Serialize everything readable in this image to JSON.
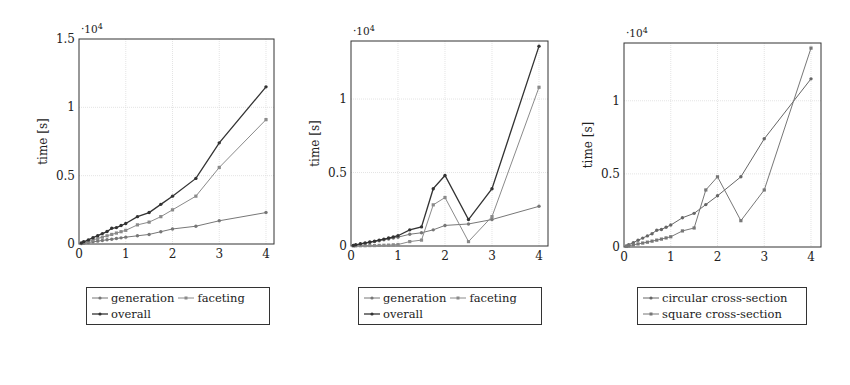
{
  "chart_data": [
    {
      "type": "line",
      "title": "",
      "xlabel": "number of structural members",
      "x_multiplier": "·10^5",
      "ylabel": "time [s]",
      "y_multiplier": "·10^4",
      "xlim": [
        0,
        4.2
      ],
      "ylim": [
        0,
        1.5
      ],
      "xticks": [
        "0",
        "1",
        "2",
        "3",
        "4"
      ],
      "yticks": [
        "0",
        "0.5",
        "1",
        "1.5"
      ],
      "grid": true,
      "legend_position": "below",
      "x": [
        0.05,
        0.1,
        0.2,
        0.3,
        0.4,
        0.5,
        0.6,
        0.7,
        0.8,
        0.9,
        1.0,
        1.25,
        1.5,
        1.75,
        2.0,
        2.5,
        3.0,
        4.0
      ],
      "series": [
        {
          "name": "generation",
          "color": "#777777",
          "marker": "circle",
          "values": [
            0.003,
            0.006,
            0.011,
            0.016,
            0.021,
            0.026,
            0.031,
            0.035,
            0.04,
            0.045,
            0.05,
            0.06,
            0.07,
            0.09,
            0.11,
            0.13,
            0.17,
            0.23
          ]
        },
        {
          "name": "faceting",
          "color": "#8a8a8a",
          "marker": "square",
          "values": [
            0.004,
            0.01,
            0.019,
            0.03,
            0.04,
            0.05,
            0.06,
            0.07,
            0.08,
            0.09,
            0.1,
            0.14,
            0.16,
            0.2,
            0.25,
            0.35,
            0.56,
            0.91
          ]
        },
        {
          "name": "overall",
          "color": "#333333",
          "marker": "circle",
          "values": [
            0.007,
            0.016,
            0.03,
            0.046,
            0.061,
            0.076,
            0.091,
            0.115,
            0.12,
            0.135,
            0.15,
            0.2,
            0.23,
            0.29,
            0.35,
            0.48,
            0.74,
            1.15
          ]
        }
      ]
    },
    {
      "type": "line",
      "title": "",
      "xlabel": "number of structural members",
      "x_multiplier": "·10^5",
      "ylabel": "time [s]",
      "y_multiplier": "·10^4",
      "xlim": [
        0,
        4.2
      ],
      "ylim": [
        0,
        1.39
      ],
      "xticks": [
        "0",
        "1",
        "2",
        "3",
        "4"
      ],
      "yticks": [
        "0",
        "0.5",
        "1"
      ],
      "grid": true,
      "legend_position": "below",
      "x": [
        0.05,
        0.1,
        0.2,
        0.3,
        0.4,
        0.5,
        0.6,
        0.7,
        0.8,
        0.9,
        1.0,
        1.25,
        1.5,
        1.75,
        2.0,
        2.5,
        3.0,
        4.0
      ],
      "series": [
        {
          "name": "generation",
          "color": "#777777",
          "marker": "circle",
          "values": [
            0.003,
            0.006,
            0.012,
            0.018,
            0.024,
            0.03,
            0.036,
            0.042,
            0.048,
            0.054,
            0.06,
            0.08,
            0.09,
            0.11,
            0.14,
            0.15,
            0.18,
            0.27
          ]
        },
        {
          "name": "faceting",
          "color": "#8a8a8a",
          "marker": "square",
          "values": [
            0.0005,
            0.001,
            0.002,
            0.002,
            0.003,
            0.003,
            0.004,
            0.005,
            0.006,
            0.008,
            0.01,
            0.03,
            0.04,
            0.28,
            0.33,
            0.03,
            0.2,
            1.08
          ]
        },
        {
          "name": "overall",
          "color": "#333333",
          "marker": "circle",
          "values": [
            0.004,
            0.008,
            0.015,
            0.021,
            0.027,
            0.033,
            0.04,
            0.047,
            0.054,
            0.062,
            0.07,
            0.11,
            0.13,
            0.39,
            0.48,
            0.18,
            0.39,
            1.36
          ]
        }
      ]
    },
    {
      "type": "line",
      "title": "",
      "xlabel": "number of structural members",
      "x_multiplier": "·10^5",
      "ylabel": "time [s]",
      "y_multiplier": "·10^4",
      "xlim": [
        0,
        4.2
      ],
      "ylim": [
        0,
        1.39
      ],
      "xticks": [
        "0",
        "1",
        "2",
        "3",
        "4"
      ],
      "yticks": [
        "0",
        "0.5",
        "1"
      ],
      "grid": true,
      "legend_position": "below",
      "x": [
        0.05,
        0.1,
        0.2,
        0.3,
        0.4,
        0.5,
        0.6,
        0.7,
        0.8,
        0.9,
        1.0,
        1.25,
        1.5,
        1.75,
        2.0,
        2.5,
        3.0,
        4.0
      ],
      "series": [
        {
          "name": "circular cross-section",
          "color": "#666666",
          "marker": "circle",
          "values": [
            0.007,
            0.016,
            0.03,
            0.046,
            0.061,
            0.076,
            0.091,
            0.115,
            0.12,
            0.135,
            0.15,
            0.2,
            0.23,
            0.29,
            0.35,
            0.48,
            0.74,
            1.15
          ]
        },
        {
          "name": "square cross-section",
          "color": "#777777",
          "marker": "square",
          "values": [
            0.004,
            0.008,
            0.015,
            0.021,
            0.027,
            0.033,
            0.04,
            0.047,
            0.054,
            0.062,
            0.07,
            0.11,
            0.13,
            0.39,
            0.48,
            0.18,
            0.39,
            1.36
          ]
        }
      ]
    }
  ],
  "panels": [
    {
      "ylabel": "time [s]",
      "xlabel": "number of structural members",
      "ymult_base": "·10",
      "ymult_exp": "4",
      "xmult_base": "·10",
      "xmult_exp": "5",
      "legend": [
        {
          "label": "generation"
        },
        {
          "label": "faceting"
        },
        {
          "label": "overall"
        }
      ]
    },
    {
      "ylabel": "time [s]",
      "xlabel": "number of structural members",
      "ymult_base": "·10",
      "ymult_exp": "4",
      "xmult_base": "·10",
      "xmult_exp": "5",
      "legend": [
        {
          "label": "generation"
        },
        {
          "label": "faceting"
        },
        {
          "label": "overall"
        }
      ]
    },
    {
      "ylabel": "time [s]",
      "xlabel": "number of structural members",
      "ymult_base": "·10",
      "ymult_exp": "4",
      "xmult_base": "·10",
      "xmult_exp": "5",
      "legend": [
        {
          "label": "circular cross-section"
        },
        {
          "label": "square cross-section"
        }
      ]
    }
  ]
}
